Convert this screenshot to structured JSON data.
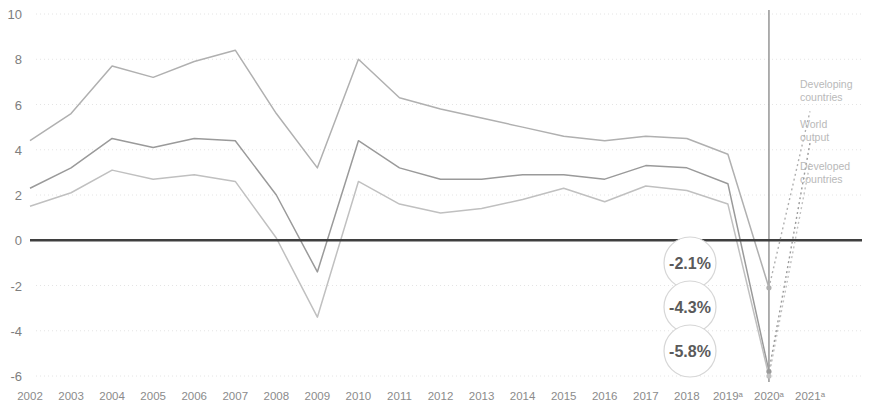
{
  "chart_data": {
    "type": "line",
    "title": "",
    "subtitle": "",
    "xlabel": "",
    "ylabel": "",
    "grid": true,
    "legend_position": "right-inline",
    "xlim": [
      2002,
      2021
    ],
    "ylim": [
      -6,
      10
    ],
    "yticks": [
      "10",
      "8",
      "6",
      "4",
      "2",
      "0",
      "-2",
      "-4",
      "-6"
    ],
    "ytick_values": [
      10,
      8,
      6,
      4,
      2,
      0,
      -2,
      -4,
      -6
    ],
    "categories": [
      "2002",
      "2003",
      "2004",
      "2005",
      "2006",
      "2007",
      "2008",
      "2009",
      "2010",
      "2011",
      "2012",
      "2013",
      "2014",
      "2015",
      "2016",
      "2017",
      "2018",
      "2019ᵃ",
      "2020ᵃ",
      "2021ᵃ"
    ],
    "series": [
      {
        "name": "Developing countries",
        "color": "#b0b0b0",
        "values": [
          4.4,
          5.6,
          7.7,
          7.2,
          7.9,
          8.4,
          5.6,
          3.2,
          8.0,
          6.3,
          5.8,
          5.4,
          5.0,
          4.6,
          4.4,
          4.6,
          4.5,
          3.8,
          -2.1,
          5.7
        ],
        "last_solid_index": 18,
        "projection_dotted_from": 18
      },
      {
        "name": "World output",
        "color": "#9a9a9a",
        "values": [
          2.3,
          3.2,
          4.5,
          4.1,
          4.5,
          4.4,
          2.0,
          -1.4,
          4.4,
          3.2,
          2.7,
          2.7,
          2.9,
          2.9,
          2.7,
          3.3,
          3.2,
          2.5,
          -5.8,
          4.3
        ],
        "last_solid_index": 18,
        "projection_dotted_from": 18
      },
      {
        "name": "Developed countries",
        "color": "#c0c0c0",
        "values": [
          1.5,
          2.1,
          3.1,
          2.7,
          2.9,
          2.6,
          0.1,
          -3.4,
          2.6,
          1.6,
          1.2,
          1.4,
          1.8,
          2.3,
          1.7,
          2.4,
          2.2,
          1.6,
          -6.0,
          3.4
        ],
        "last_solid_index": 18,
        "projection_dotted_from": 18
      }
    ],
    "annotations": [
      {
        "id": "callout-developing",
        "label": "-2.1%",
        "value": -2.1,
        "year": "2020ᵃ",
        "series": "Developing countries"
      },
      {
        "id": "callout-world",
        "label": "-4.3%",
        "value": -4.3,
        "year": "2020ᵃ",
        "series": "World output"
      },
      {
        "id": "callout-developed",
        "label": "-5.8%",
        "value": -5.8,
        "year": "2020ᵃ",
        "series": "Developed countries"
      }
    ],
    "marker_line": {
      "year": "2020ᵃ",
      "description": "vertical reference line at 2020"
    },
    "zero_line": {
      "value": 0,
      "color": "#444444"
    },
    "footnote_marker": "ᵃ"
  },
  "legend": {
    "items": [
      {
        "label_line1": "Developing",
        "label_line2": "countries"
      },
      {
        "label_line1": "World",
        "label_line2": "output"
      },
      {
        "label_line1": "Developed",
        "label_line2": "countries"
      }
    ]
  },
  "colors": {
    "grid": "#e4e4e4",
    "zero_axis": "#3f3f3f",
    "marker_line": "#8d8d8d",
    "callout_fill": "#ffffff",
    "callout_stroke": "#d6d6d6",
    "callout_text": "#5a5a5a",
    "ytick_text": "#7e7e7e",
    "xtick_text": "#8b8b8b",
    "legend_text": "#b9b9b9"
  }
}
